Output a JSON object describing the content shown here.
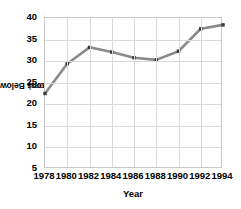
{
  "chart_data": {
    "type": "line",
    "title": "",
    "subtitle": "",
    "xlabel": "Year",
    "ylabel": "Persons Below Poverty Level (in millions)",
    "ylabel_bold_part": "Persons Below Poverty Level ",
    "ylabel_light_part": "(in millions)",
    "x": [
      1978,
      1980,
      1982,
      1984,
      1986,
      1988,
      1990,
      1992,
      1994
    ],
    "categories": [
      "1978",
      "1980",
      "1982",
      "1984",
      "1986",
      "1988",
      "1990",
      "1992",
      "1994"
    ],
    "values": [
      22.5,
      29.4,
      33.2,
      32.1,
      30.8,
      30.3,
      32.3,
      37.5,
      38.4
    ],
    "series": [
      {
        "name": "Persons Below Poverty Level",
        "values": [
          22.5,
          29.4,
          33.2,
          32.1,
          30.8,
          30.3,
          32.3,
          37.5,
          38.4
        ]
      }
    ],
    "xlim": [
      1978,
      1994
    ],
    "ylim": [
      5,
      40
    ],
    "ytick_labels": [
      "40",
      "35",
      "30",
      "25",
      "20",
      "15",
      "10",
      "5"
    ],
    "ytick_values": [
      40,
      35,
      30,
      25,
      20,
      15,
      10,
      5
    ],
    "xtick_labels": [
      "1978",
      "1980",
      "1982",
      "1984",
      "1986",
      "1988",
      "1990",
      "1992",
      "1994"
    ],
    "grid": true,
    "legend": false,
    "legend_position": "none",
    "line_color": "#8a8a8a",
    "marker_color": "#3c3c3c",
    "grid_color": "#d9d9dd",
    "frame_color": "#c8c8cc",
    "text_color": "#000000",
    "background_color": "#ffffff"
  }
}
